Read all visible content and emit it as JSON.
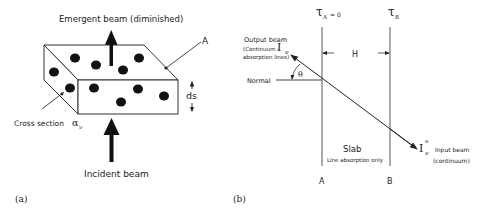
{
  "panel_a": {
    "label": "(a)",
    "emergent_beam": "Emergent beam (diminished)",
    "incident_beam": "Incident beam",
    "area_label": "A",
    "thickness_label": "ds",
    "cross_section_label": "Cross section",
    "cross_section_symbol": "α",
    "cross_section_subscript": "ν"
  },
  "panel_b": {
    "label": "(b)",
    "tau_a": "τ",
    "tau_a_sub": "A",
    "tau_a_value": "= 0",
    "tau_b": "τ",
    "tau_b_sub": "B",
    "width_label": "H",
    "output_beam_line1": "Output beam",
    "output_beam_line2": "(Continuum -",
    "output_beam_line3": "absorption lines)",
    "output_intensity": "I",
    "output_intensity_sub": "ν",
    "normal_label": "Normal",
    "angle_label": "θ",
    "slab_label": "Slab",
    "slab_sublabel": "Line absorption only",
    "input_intensity": "I",
    "input_intensity_sub": "ν",
    "input_intensity_sup": "o",
    "input_beam_line1": "Input beam",
    "input_beam_line2": "(continuum)",
    "boundary_a": "A",
    "boundary_b": "B"
  }
}
